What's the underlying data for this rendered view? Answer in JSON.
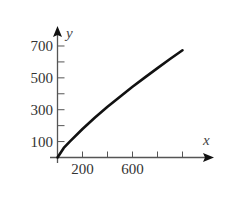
{
  "chart_data": {
    "type": "line",
    "title": "",
    "xlabel": "x",
    "ylabel": "y",
    "x_ticks": [
      200,
      400,
      600,
      800,
      1000
    ],
    "x_tick_labels": [
      "200",
      "",
      "600",
      "",
      ""
    ],
    "y_ticks": [
      100,
      200,
      300,
      400,
      500,
      600,
      700
    ],
    "y_tick_labels": [
      "100",
      "",
      "300",
      "",
      "500",
      "",
      "700"
    ],
    "xlim": [
      0,
      1100
    ],
    "ylim": [
      0,
      780
    ],
    "grid": false,
    "legend": null,
    "series": [
      {
        "name": "curve",
        "x": [
          0,
          50,
          100,
          200,
          300,
          400,
          500,
          600,
          700,
          800,
          900,
          1000
        ],
        "y": [
          0,
          60,
          101,
          179,
          251,
          318,
          382,
          444,
          503,
          561,
          618,
          673
        ]
      }
    ],
    "colors": {
      "axis": "#555555",
      "curve": "#111111",
      "text": "#333333"
    }
  }
}
